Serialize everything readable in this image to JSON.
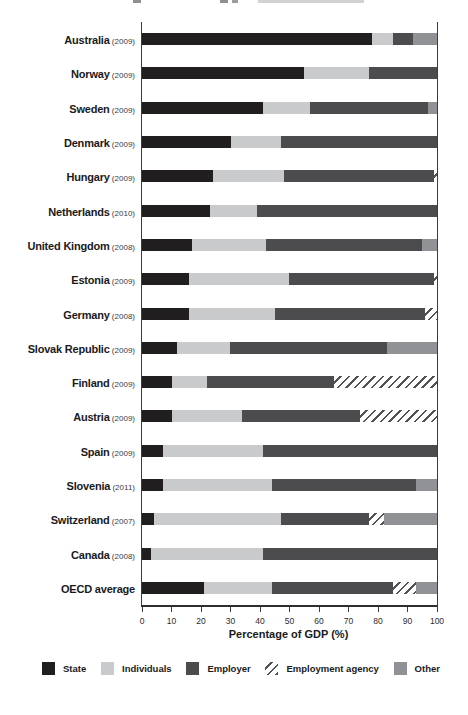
{
  "chart_data": {
    "type": "bar",
    "orientation": "horizontal",
    "stacked": true,
    "title": "",
    "xlabel": "Percentage of GDP (%)",
    "ylabel": "",
    "xlim": [
      0,
      100
    ],
    "xticks": [
      0,
      10,
      20,
      30,
      40,
      50,
      60,
      70,
      80,
      90,
      100
    ],
    "grid": false,
    "legend_position": "bottom",
    "series_names": [
      "State",
      "Individuals",
      "Employer",
      "Employment agency",
      "Other"
    ],
    "rows": [
      {
        "country": "Australia",
        "year_label": "(2009)",
        "values": [
          78,
          7,
          7,
          0,
          8
        ]
      },
      {
        "country": "Norway",
        "year_label": "(2009)",
        "values": [
          55,
          22,
          23,
          0,
          0
        ]
      },
      {
        "country": "Sweden",
        "year_label": "(2009)",
        "values": [
          41,
          16,
          40,
          0,
          3
        ]
      },
      {
        "country": "Denmark",
        "year_label": "(2009)",
        "values": [
          30,
          17,
          53,
          0,
          0
        ]
      },
      {
        "country": "Hungary",
        "year_label": "(2009)",
        "values": [
          24,
          24,
          51,
          1,
          0
        ]
      },
      {
        "country": "Netherlands",
        "year_label": "(2010)",
        "values": [
          23,
          16,
          61,
          0,
          0
        ]
      },
      {
        "country": "United Kingdom",
        "year_label": "(2008)",
        "values": [
          17,
          25,
          53,
          0,
          5
        ]
      },
      {
        "country": "Estonia",
        "year_label": "(2009)",
        "values": [
          16,
          34,
          49,
          1,
          0
        ]
      },
      {
        "country": "Germany",
        "year_label": "(2008)",
        "values": [
          16,
          29,
          51,
          4,
          0
        ]
      },
      {
        "country": "Slovak Republic",
        "year_label": "(2009)",
        "values": [
          12,
          18,
          53,
          0,
          17
        ]
      },
      {
        "country": "Finland",
        "year_label": "(2009)",
        "values": [
          10,
          12,
          43,
          35,
          0
        ]
      },
      {
        "country": "Austria",
        "year_label": "(2009)",
        "values": [
          10,
          24,
          40,
          26,
          0
        ]
      },
      {
        "country": "Spain",
        "year_label": "(2009)",
        "values": [
          7,
          34,
          59,
          0,
          0
        ]
      },
      {
        "country": "Slovenia",
        "year_label": "(2011)",
        "values": [
          7,
          37,
          49,
          0,
          7
        ]
      },
      {
        "country": "Switzerland",
        "year_label": "(2007)",
        "values": [
          4,
          43,
          30,
          5,
          18
        ]
      },
      {
        "country": "Canada",
        "year_label": "(2008)",
        "values": [
          3,
          38,
          59,
          0,
          0
        ]
      },
      {
        "country": "OECD average",
        "year_label": "",
        "values": [
          21,
          23,
          41,
          8,
          7
        ]
      }
    ],
    "legend": [
      {
        "label": "State",
        "color": "#211e1f",
        "pattern": "solid"
      },
      {
        "label": "Individuals",
        "color": "#c9cacb",
        "pattern": "solid"
      },
      {
        "label": "Employer",
        "color": "#4c4c4e",
        "pattern": "solid"
      },
      {
        "label": "Employment agency",
        "color": "#515254",
        "pattern": "hatch"
      },
      {
        "label": "Other",
        "color": "#909295",
        "pattern": "solid"
      }
    ]
  }
}
